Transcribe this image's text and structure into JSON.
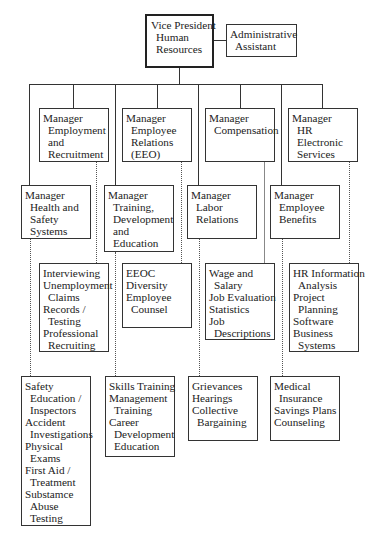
{
  "vp": {
    "lines": [
      {
        "t": "Vice President",
        "i": false
      },
      {
        "t": "Human",
        "i": true
      },
      {
        "t": "Resources",
        "i": true
      }
    ]
  },
  "assistant": {
    "lines": [
      {
        "t": "Administrative",
        "i": false
      },
      {
        "t": "Assistant",
        "i": true
      }
    ]
  },
  "managers": {
    "employment": {
      "lines": [
        {
          "t": "Manager",
          "i": false
        },
        {
          "t": "Employment",
          "i": true
        },
        {
          "t": "and",
          "i": true
        },
        {
          "t": "Recruitment",
          "i": true
        }
      ]
    },
    "employee_relations": {
      "lines": [
        {
          "t": "Manager",
          "i": false
        },
        {
          "t": "Employee",
          "i": true
        },
        {
          "t": "Relations",
          "i": true
        },
        {
          "t": "(EEO)",
          "i": true
        }
      ]
    },
    "compensation": {
      "lines": [
        {
          "t": "Manager",
          "i": false
        },
        {
          "t": "Compensation",
          "i": true
        }
      ]
    },
    "hr_electronic": {
      "lines": [
        {
          "t": "Manager",
          "i": false
        },
        {
          "t": "HR",
          "i": true
        },
        {
          "t": "Electronic",
          "i": true
        },
        {
          "t": "Services",
          "i": true
        }
      ]
    },
    "health_safety": {
      "lines": [
        {
          "t": "Manager",
          "i": false
        },
        {
          "t": "Health and",
          "i": true
        },
        {
          "t": "Safety",
          "i": true
        },
        {
          "t": "Systems",
          "i": true
        }
      ]
    },
    "training": {
      "lines": [
        {
          "t": "Manager",
          "i": false
        },
        {
          "t": "Training,",
          "i": true
        },
        {
          "t": "Development",
          "i": true
        },
        {
          "t": "and",
          "i": true
        },
        {
          "t": "Education",
          "i": true
        }
      ]
    },
    "labor": {
      "lines": [
        {
          "t": "Manager",
          "i": false
        },
        {
          "t": "Labor",
          "i": true
        },
        {
          "t": "Relations",
          "i": true
        }
      ]
    },
    "benefits": {
      "lines": [
        {
          "t": "Manager",
          "i": false
        },
        {
          "t": "Employee",
          "i": true
        },
        {
          "t": "Benefits",
          "i": true
        }
      ]
    }
  },
  "functions": {
    "employment": {
      "lines": [
        {
          "t": "Interviewing",
          "i": false
        },
        {
          "t": "Unemployment",
          "i": false
        },
        {
          "t": "Claims",
          "i": true
        },
        {
          "t": "Records /",
          "i": false
        },
        {
          "t": "Testing",
          "i": true
        },
        {
          "t": "Professional",
          "i": false
        },
        {
          "t": "Recruiting",
          "i": true
        }
      ]
    },
    "employee_relations": {
      "lines": [
        {
          "t": "EEOC",
          "i": false
        },
        {
          "t": "Diversity",
          "i": false
        },
        {
          "t": "Employee",
          "i": false
        },
        {
          "t": "Counsel",
          "i": true
        }
      ]
    },
    "compensation": {
      "lines": [
        {
          "t": "Wage and",
          "i": false
        },
        {
          "t": "Salary",
          "i": true
        },
        {
          "t": "Job Evaluation",
          "i": false
        },
        {
          "t": "Statistics",
          "i": false
        },
        {
          "t": "Job",
          "i": false
        },
        {
          "t": "Descriptions",
          "i": true
        }
      ]
    },
    "hr_electronic": {
      "lines": [
        {
          "t": "HR Information",
          "i": false
        },
        {
          "t": "Analysis",
          "i": true
        },
        {
          "t": "Project",
          "i": false
        },
        {
          "t": "Planning",
          "i": true
        },
        {
          "t": "Software",
          "i": false
        },
        {
          "t": "Business",
          "i": false
        },
        {
          "t": "Systems",
          "i": true
        }
      ]
    },
    "health_safety": {
      "lines": [
        {
          "t": "Safety",
          "i": false
        },
        {
          "t": "Education /",
          "i": true
        },
        {
          "t": "Inspectors",
          "i": true
        },
        {
          "t": "Accident",
          "i": false
        },
        {
          "t": "Investigations",
          "i": true
        },
        {
          "t": "Physical",
          "i": false
        },
        {
          "t": "Exams",
          "i": true
        },
        {
          "t": "First Aid /",
          "i": false
        },
        {
          "t": "Treatment",
          "i": true
        },
        {
          "t": "Substamce",
          "i": false
        },
        {
          "t": "Abuse",
          "i": true
        },
        {
          "t": "Testing",
          "i": true
        }
      ]
    },
    "training": {
      "lines": [
        {
          "t": "Skills Training",
          "i": false
        },
        {
          "t": "Management",
          "i": false
        },
        {
          "t": "Training",
          "i": true
        },
        {
          "t": "Career",
          "i": false
        },
        {
          "t": "Development",
          "i": true
        },
        {
          "t": "Education",
          "i": true
        }
      ]
    },
    "labor": {
      "lines": [
        {
          "t": "Grievances",
          "i": false
        },
        {
          "t": "Hearings",
          "i": false
        },
        {
          "t": "Collective",
          "i": false
        },
        {
          "t": "Bargaining",
          "i": true
        }
      ]
    },
    "benefits": {
      "lines": [
        {
          "t": "Medical",
          "i": false
        },
        {
          "t": "Insurance",
          "i": true
        },
        {
          "t": "Savings Plans",
          "i": false
        },
        {
          "t": "Counseling",
          "i": false
        }
      ]
    }
  }
}
